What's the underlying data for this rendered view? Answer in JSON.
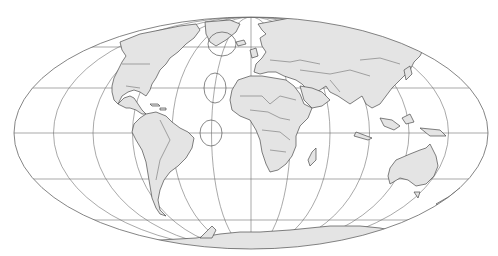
{
  "map": {
    "projection": "Mollweide",
    "graticule": {
      "meridian_interval_deg": 30,
      "parallel_interval_deg": 30,
      "parallels": [
        "60N",
        "30N",
        "0",
        "30S",
        "60S"
      ]
    },
    "tissot_indicatrix": [
      {
        "label": "tissot-60N"
      },
      {
        "label": "tissot-30N"
      },
      {
        "label": "tissot-0"
      }
    ],
    "colors": {
      "land": "#e4e4e4",
      "coastline": "#4a4a4a",
      "graticule": "#6e6e6e",
      "ocean": "#ffffff"
    },
    "continents": [
      "North America",
      "South America",
      "Greenland",
      "Europe",
      "Africa",
      "Asia",
      "Australia",
      "Antarctica",
      "Madagascar",
      "New Zealand"
    ]
  }
}
